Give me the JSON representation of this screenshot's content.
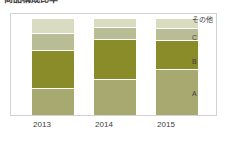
{
  "heading": {
    "text": "商品構成比率"
  },
  "chart_data": {
    "type": "bar",
    "subtype": "stacked-column-100pct",
    "title": "",
    "xlabel": "",
    "ylabel": "",
    "grid": false,
    "legend_position": "right",
    "legend_order": "top-to-bottom",
    "categories": [
      "2013",
      "2014",
      "2015"
    ],
    "series": [
      {
        "name": "その他",
        "color": "#d9dcc0",
        "values": [
          15,
          9,
          10
        ],
        "stack_position": 1
      },
      {
        "name": "C",
        "color": "#b9bd96",
        "values": [
          17,
          11,
          12
        ],
        "stack_position": 2
      },
      {
        "name": "B",
        "color": "#8a8c2a",
        "values": [
          40,
          42,
          30
        ],
        "stack_position": 3
      },
      {
        "name": "A",
        "color": "#a8a871",
        "values": [
          28,
          38,
          48
        ],
        "stack_position": 4
      }
    ],
    "ylim": [
      0,
      100
    ],
    "unit": "%"
  },
  "legend": {
    "items": [
      {
        "label": "その他",
        "top": 2
      },
      {
        "label": "C",
        "top": 20
      },
      {
        "label": "B",
        "top": 44
      },
      {
        "label": "A",
        "top": 76
      }
    ]
  },
  "axis": {
    "ticks": [
      "2013",
      "2014",
      "2015"
    ]
  },
  "colors": {
    "frame_border": "#d2d2d2",
    "background": "#ffffff",
    "text": "#3d3d3d",
    "segment_gap": "#ffffff"
  }
}
